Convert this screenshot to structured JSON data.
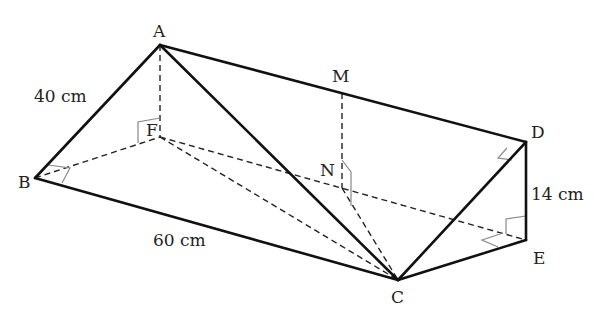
{
  "diagram": {
    "type": "triangular-prism",
    "colors": {
      "edge": "#111111",
      "hidden_edge": "#222222",
      "right_angle_marker": "#888888",
      "background": "#ffffff"
    },
    "vertices": {
      "A": {
        "label": "A",
        "x": 160,
        "y": 45
      },
      "B": {
        "label": "B",
        "x": 35,
        "y": 178
      },
      "C": {
        "label": "C",
        "x": 398,
        "y": 280
      },
      "D": {
        "label": "D",
        "x": 526,
        "y": 142
      },
      "E": {
        "label": "E",
        "x": 526,
        "y": 240
      },
      "F": {
        "label": "F",
        "x": 160,
        "y": 137
      },
      "M": {
        "label": "M",
        "x": 342,
        "y": 93
      },
      "N": {
        "label": "N",
        "x": 342,
        "y": 188
      }
    },
    "measurements": {
      "AB": "40 cm",
      "BC": "60 cm",
      "DE": "14 cm"
    },
    "solid_edges": [
      "AB",
      "AD",
      "AC",
      "BC",
      "CD",
      "CE",
      "DE"
    ],
    "dashed_edges": [
      "AF",
      "BF",
      "FE",
      "FC",
      "MN",
      "NC"
    ],
    "right_angles": [
      "AFB",
      "ABF",
      "ADC",
      "DEF",
      "MNC"
    ]
  }
}
